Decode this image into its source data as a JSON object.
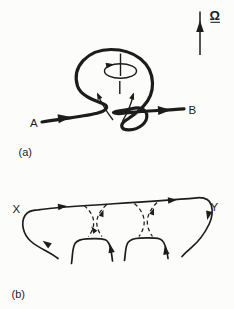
{
  "panel_a": {
    "label": "(a)",
    "point_left": "A",
    "point_right": "B",
    "angular_velocity_symbol": "Ω"
  },
  "panel_b": {
    "label": "(b)",
    "point_left": "X",
    "point_right": "Y"
  },
  "colors": {
    "ink": "#1c1c1c",
    "background": "#fcfcfb"
  }
}
